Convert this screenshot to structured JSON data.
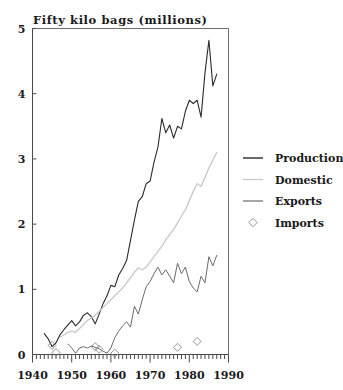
{
  "chart_data": {
    "type": "line",
    "title": "Fifty kilo bags (millions)",
    "xlabel": "",
    "ylabel": "Fifty kilo bags (millions)",
    "xlim": [
      1940,
      1990
    ],
    "ylim": [
      0,
      5
    ],
    "grid": false,
    "legend_position": "right",
    "x_ticks": [
      1940,
      1950,
      1960,
      1970,
      1980,
      1990
    ],
    "x_tick_labels": [
      "1940",
      "1950",
      "1960",
      "1970",
      "1980",
      "1990"
    ],
    "x_minor_tick_step": 1,
    "y_ticks": [
      0,
      1,
      2,
      3,
      4,
      5
    ],
    "y_tick_labels": [
      "0",
      "1",
      "2",
      "3",
      "4",
      "5"
    ],
    "series": [
      {
        "name": "Production",
        "type": "line",
        "color": "#2b2b2b",
        "width": 1.1,
        "x": [
          1943,
          1944,
          1945,
          1946,
          1947,
          1948,
          1949,
          1950,
          1951,
          1952,
          1953,
          1954,
          1955,
          1956,
          1957,
          1958,
          1959,
          1960,
          1961,
          1962,
          1963,
          1964,
          1965,
          1966,
          1967,
          1968,
          1969,
          1970,
          1971,
          1972,
          1973,
          1974,
          1975,
          1976,
          1977,
          1978,
          1979,
          1980,
          1981,
          1982,
          1983,
          1984,
          1985,
          1986,
          1987
        ],
        "values": [
          0.32,
          0.24,
          0.12,
          0.18,
          0.3,
          0.38,
          0.45,
          0.52,
          0.44,
          0.5,
          0.6,
          0.64,
          0.58,
          0.47,
          0.62,
          0.78,
          0.9,
          1.06,
          1.04,
          1.22,
          1.32,
          1.44,
          1.75,
          2.06,
          2.35,
          2.42,
          2.62,
          2.66,
          2.95,
          3.18,
          3.62,
          3.4,
          3.52,
          3.32,
          3.5,
          3.46,
          3.73,
          3.9,
          3.85,
          3.9,
          3.64,
          4.32,
          4.82,
          4.12,
          4.3
        ]
      },
      {
        "name": "Domestic",
        "type": "line",
        "color": "#c8c8c8",
        "width": 1.3,
        "x": [
          1947,
          1948,
          1949,
          1950,
          1951,
          1952,
          1953,
          1954,
          1955,
          1956,
          1957,
          1958,
          1959,
          1960,
          1961,
          1962,
          1963,
          1964,
          1965,
          1966,
          1967,
          1968,
          1969,
          1970,
          1971,
          1972,
          1973,
          1974,
          1975,
          1976,
          1977,
          1978,
          1979,
          1980,
          1981,
          1982,
          1983,
          1984,
          1985,
          1986,
          1987
        ],
        "values": [
          0.26,
          0.3,
          0.34,
          0.36,
          0.34,
          0.4,
          0.46,
          0.52,
          0.56,
          0.6,
          0.66,
          0.72,
          0.78,
          0.84,
          0.9,
          0.96,
          1.02,
          1.1,
          1.18,
          1.26,
          1.33,
          1.3,
          1.34,
          1.42,
          1.5,
          1.58,
          1.66,
          1.76,
          1.84,
          1.92,
          2.02,
          2.12,
          2.22,
          2.36,
          2.5,
          2.62,
          2.58,
          2.72,
          2.86,
          2.98,
          3.1
        ]
      },
      {
        "name": "Exports",
        "type": "line",
        "color": "#6b6b6b",
        "width": 1.0,
        "x": [
          1949,
          1950,
          1951,
          1952,
          1953,
          1954,
          1955,
          1956,
          1957,
          1958,
          1959,
          1960,
          1961,
          1962,
          1963,
          1964,
          1965,
          1966,
          1967,
          1968,
          1969,
          1970,
          1971,
          1972,
          1973,
          1974,
          1975,
          1976,
          1977,
          1978,
          1979,
          1980,
          1981,
          1982,
          1983,
          1984,
          1985,
          1986,
          1987
        ],
        "values": [
          0.16,
          0.1,
          0.02,
          0.1,
          0.12,
          0.1,
          0.13,
          0.11,
          0.09,
          0.05,
          0.02,
          0.1,
          0.26,
          0.36,
          0.44,
          0.5,
          0.42,
          0.74,
          0.62,
          0.84,
          1.04,
          1.12,
          1.24,
          1.34,
          1.22,
          1.3,
          1.2,
          1.1,
          1.4,
          1.24,
          1.34,
          1.12,
          1.02,
          0.96,
          1.2,
          1.1,
          1.5,
          1.36,
          1.52
        ]
      },
      {
        "name": "Imports",
        "type": "scatter",
        "marker": "diamond",
        "color": "#8a8a8a",
        "x": [
          1945,
          1946,
          1956,
          1957,
          1961,
          1977,
          1982
        ],
        "values": [
          0.14,
          0.03,
          0.12,
          0.08,
          0.02,
          0.11,
          0.2
        ]
      }
    ],
    "legend_entries": [
      {
        "label": "Production",
        "style": "line",
        "color": "#2b2b2b"
      },
      {
        "label": "Domestic",
        "style": "line",
        "color": "#c8c8c8"
      },
      {
        "label": "Exports",
        "style": "line",
        "color": "#6b6b6b"
      },
      {
        "label": "Imports",
        "style": "diamond",
        "color": "#8a8a8a"
      }
    ]
  }
}
